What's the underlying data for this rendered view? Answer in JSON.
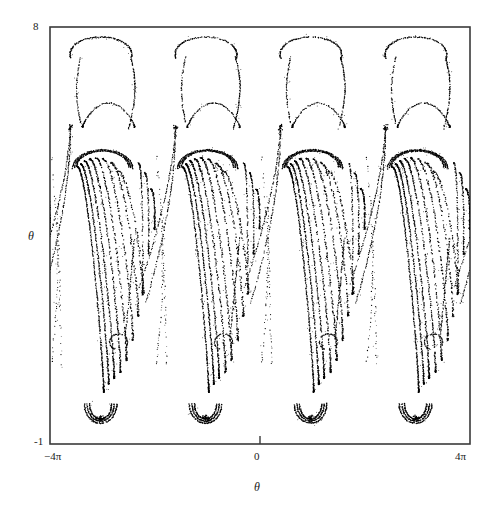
{
  "figure": {
    "background": "#ffffff",
    "ink_color": "#000000",
    "frame_color": "#333333"
  },
  "axes": {
    "y_top_label": "8",
    "y_bottom_label": "-1",
    "y_axis_name": "θ",
    "x_left_label": "−4π",
    "x_mid_label": "0",
    "x_right_label": "4π",
    "x_axis_name": "θ",
    "x_tick_positions": [
      0
    ],
    "y_tick_positions": []
  },
  "chart_data": {
    "type": "scatter",
    "title": "",
    "xlabel": "θ",
    "ylabel": "θ",
    "xlim": [
      -12.566370614359172,
      12.566370614359172
    ],
    "ylim": [
      -1,
      8
    ],
    "xtick_labels": [
      "−4π",
      "0",
      "4π"
    ],
    "xtick_values": [
      -12.566370614359172,
      0,
      12.566370614359172
    ],
    "ytick_labels": [
      "8",
      "-1"
    ],
    "ytick_values": [
      8,
      -1
    ],
    "grid": false,
    "legend": null,
    "marker": "point",
    "marker_size": 1.0,
    "periods": 4,
    "period_width": 6.283185307179586,
    "structure": {
      "cap_top_theta": 7.55,
      "cap_shoulder_theta": 5.6,
      "spike_tip_theta": 6.0,
      "tongue_tip_theta": -0.72,
      "filament_count": 7,
      "lobe_centers_px": [
        104,
        209,
        314,
        419
      ]
    },
    "plot_box_px": {
      "left": 50,
      "top": 27,
      "right": 470,
      "bottom": 444
    }
  }
}
